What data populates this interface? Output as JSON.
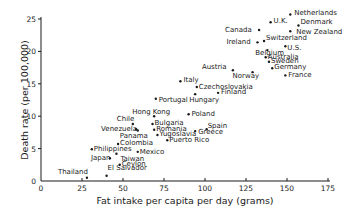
{
  "chart_data": {
    "type": "scatter",
    "title": "",
    "xlabel": "Fat intake per capita per day (grams)",
    "ylabel": "Death rate (per 100,000)",
    "xlim": [
      0,
      175
    ],
    "ylim": [
      0,
      26
    ],
    "xticks": [
      0,
      25,
      50,
      75,
      100,
      125,
      150,
      175
    ],
    "yticks": [
      0,
      5,
      10,
      15,
      20,
      25
    ],
    "grid": false,
    "legend": null,
    "points": [
      {
        "label": "Netherlands",
        "x": 152,
        "y": 25.7,
        "lx": 4,
        "ly": 1
      },
      {
        "label": "U.K.",
        "x": 140,
        "y": 24.5,
        "lx": 3,
        "ly": 1
      },
      {
        "label": "Denmark",
        "x": 157,
        "y": 24.0,
        "lx": 2,
        "ly": -1
      },
      {
        "label": "Canada",
        "x": 133,
        "y": 23.3,
        "lx": -34,
        "ly": 2
      },
      {
        "label": "New Zealand",
        "x": 152,
        "y": 23.1,
        "lx": 6,
        "ly": 3
      },
      {
        "label": "Ireland",
        "x": 132,
        "y": 21.4,
        "lx": -31,
        "ly": 2
      },
      {
        "label": "Switzerland",
        "x": 136,
        "y": 21.6,
        "lx": 2,
        "ly": -1
      },
      {
        "label": "U.S.",
        "x": 149,
        "y": 20.8,
        "lx": 0,
        "ly": 4
      },
      {
        "label": "Belgium",
        "x": 138,
        "y": 20.2,
        "lx": -12,
        "ly": 5
      },
      {
        "label": "Australia",
        "x": 137,
        "y": 19.1,
        "lx": 2,
        "ly": 0
      },
      {
        "label": "Sweden",
        "x": 139,
        "y": 18.4,
        "lx": 2,
        "ly": 1
      },
      {
        "label": "Germany",
        "x": 141,
        "y": 17.4,
        "lx": 2,
        "ly": 1
      },
      {
        "label": "Austria",
        "x": 117,
        "y": 17.1,
        "lx": -31,
        "ly": -1
      },
      {
        "label": "Norway",
        "x": 129,
        "y": 16.8,
        "lx": -20,
        "ly": 6
      },
      {
        "label": "France",
        "x": 149,
        "y": 16.3,
        "lx": 3,
        "ly": 2
      },
      {
        "label": "Italy",
        "x": 85,
        "y": 15.4,
        "lx": 3,
        "ly": 1
      },
      {
        "label": "Czechoslovakia",
        "x": 95,
        "y": 14.5,
        "lx": 2,
        "ly": 2
      },
      {
        "label": "Finland",
        "x": 108,
        "y": 13.6,
        "lx": 3,
        "ly": 1
      },
      {
        "label": "Hungary",
        "x": 94,
        "y": 13.4,
        "lx": -6,
        "ly": 8
      },
      {
        "label": "Portugal",
        "x": 70,
        "y": 12.7,
        "lx": 3,
        "ly": 3
      },
      {
        "label": "Hong Kong",
        "x": 69,
        "y": 10.0,
        "lx": -22,
        "ly": -2
      },
      {
        "label": "Poland",
        "x": 90,
        "y": 10.3,
        "lx": 3,
        "ly": 2
      },
      {
        "label": "Chile",
        "x": 56,
        "y": 8.8,
        "lx": -16,
        "ly": -3
      },
      {
        "label": "Bulgaria",
        "x": 68,
        "y": 8.8,
        "lx": 2,
        "ly": 1
      },
      {
        "label": "Venezuela",
        "x": 58,
        "y": 8.0,
        "lx": -35,
        "ly": 2
      },
      {
        "label": "Romania",
        "x": 69,
        "y": 7.9,
        "lx": 2,
        "ly": 1
      },
      {
        "label": "Spain",
        "x": 101,
        "y": 8.0,
        "lx": 1,
        "ly": -1
      },
      {
        "label": "Greece",
        "x": 94,
        "y": 7.7,
        "lx": 3,
        "ly": 3
      },
      {
        "label": "Yugoslavia",
        "x": 71,
        "y": 7.1,
        "lx": 2,
        "ly": 1
      },
      {
        "label": "Puerto Rico",
        "x": 77,
        "y": 6.3,
        "lx": 2,
        "ly": 2
      },
      {
        "label": "Panama",
        "x": 59,
        "y": 7.8,
        "lx": -18,
        "ly": 8
      },
      {
        "label": "Colombia",
        "x": 47,
        "y": 5.7,
        "lx": 2,
        "ly": 1
      },
      {
        "label": "Philippines",
        "x": 31,
        "y": 4.9,
        "lx": 2,
        "ly": 2
      },
      {
        "label": "Mexico",
        "x": 59,
        "y": 4.5,
        "lx": 2,
        "ly": 2
      },
      {
        "label": "Japan",
        "x": 42,
        "y": 3.5,
        "lx": -19,
        "ly": 2
      },
      {
        "label": "Taiwan",
        "x": 46,
        "y": 4.2,
        "lx": 4,
        "ly": 7
      },
      {
        "label": "Ceylon",
        "x": 48,
        "y": 2.5,
        "lx": 2,
        "ly": 1
      },
      {
        "label": "Thailand",
        "x": 28,
        "y": 0.5,
        "lx": -29,
        "ly": -4
      },
      {
        "label": "El Salvador",
        "x": 40,
        "y": 0.8,
        "lx": 1,
        "ly": -6
      }
    ]
  },
  "layout": {
    "x0_px": 41,
    "x_px_per_unit": 1.64,
    "y0_px": 181,
    "y_px_per_unit": 6.48,
    "x_axis_end_px": 330,
    "y_axis_top_px": 17
  }
}
